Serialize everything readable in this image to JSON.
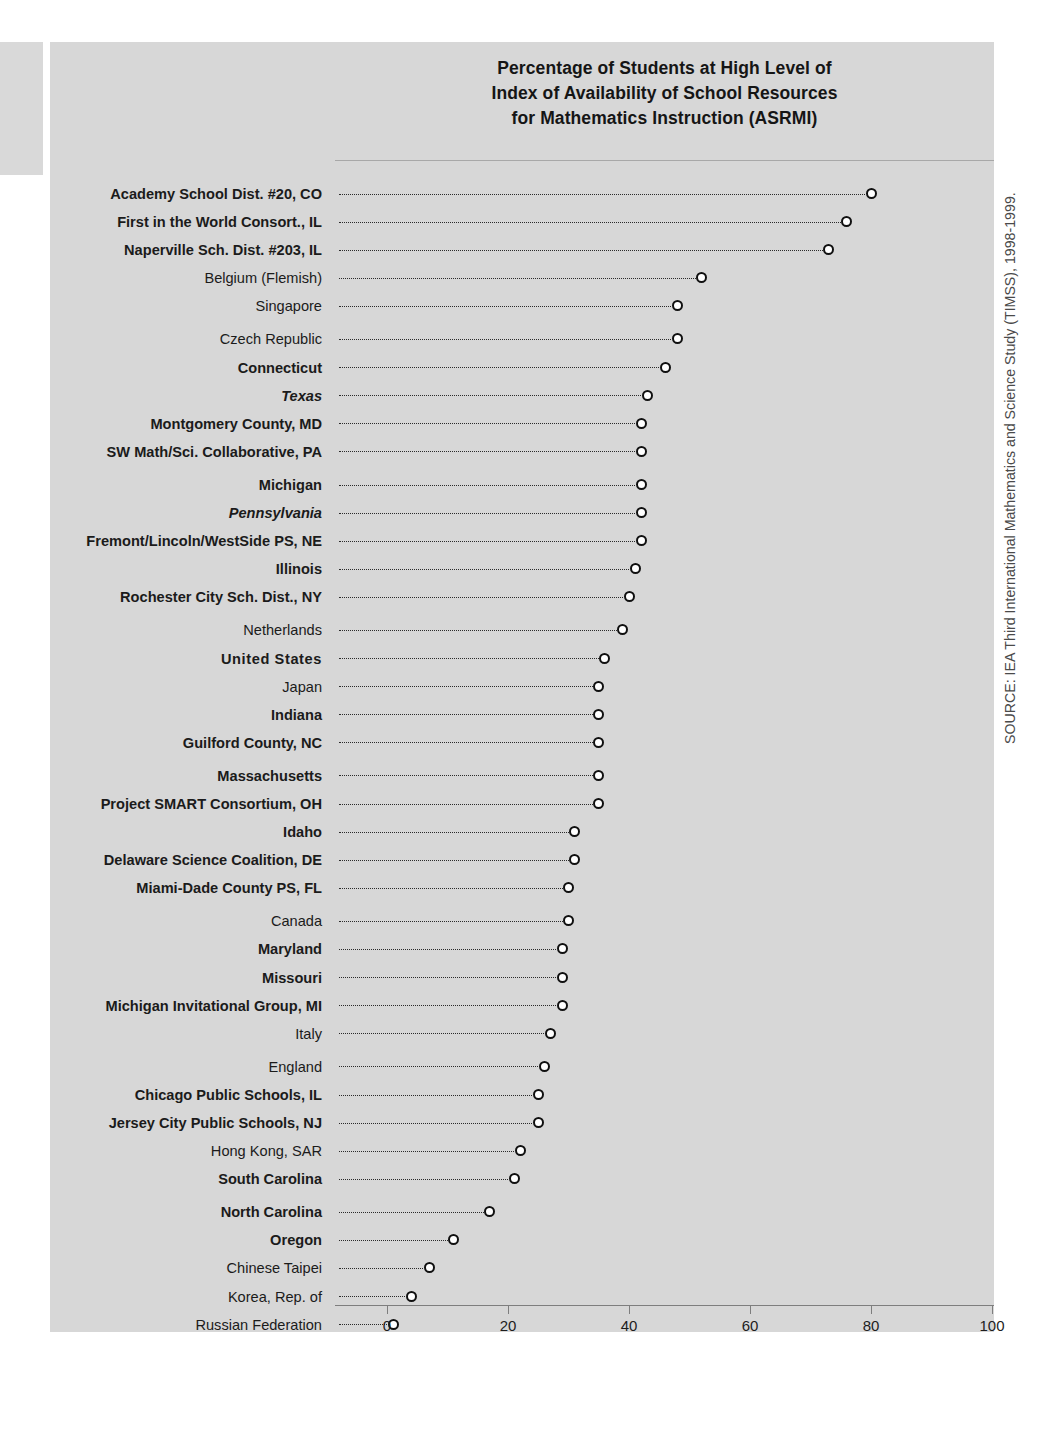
{
  "chart_data": {
    "type": "bar",
    "title": "Percentage of Students at High Level of Index of Availability of School Resources for Mathematics Instruction (ASRMI)",
    "title_lines": [
      "Percentage of Students at High Level of",
      "Index of Availability of School Resources",
      "for Mathematics Instruction (ASRMI)"
    ],
    "xlabel": "",
    "ylabel": "",
    "xlim": [
      0,
      100
    ],
    "xticks": [
      0,
      20,
      40,
      60,
      80,
      100
    ],
    "xtick_labels": [
      "0",
      "20",
      "40",
      "60",
      "80",
      "100"
    ],
    "grid": false,
    "legend": null,
    "orientation": "horizontal",
    "marker": "open-circle",
    "categories": [
      "Academy School Dist. #20, CO",
      "First in the World Consort., IL",
      "Naperville Sch. Dist. #203, IL",
      "Belgium (Flemish)",
      "Singapore",
      "Czech Republic",
      "Connecticut",
      "Texas",
      "Montgomery County, MD",
      "SW Math/Sci. Collaborative, PA",
      "Michigan",
      "Pennsylvania",
      "Fremont/Lincoln/WestSide PS, NE",
      "Illinois",
      "Rochester City Sch. Dist., NY",
      "Netherlands",
      "United States",
      "Japan",
      "Indiana",
      "Guilford County, NC",
      "Massachusetts",
      "Project SMART Consortium, OH",
      "Idaho",
      "Delaware Science Coalition, DE",
      "Miami-Dade County PS, FL",
      "Canada",
      "Maryland",
      "Missouri",
      "Michigan Invitational Group, MI",
      "Italy",
      "England",
      "Chicago Public Schools, IL",
      "Jersey City Public Schools, NJ",
      "Hong Kong, SAR",
      "South Carolina",
      "North Carolina",
      "Oregon",
      "Chinese Taipei",
      "Korea, Rep. of",
      "Russian Federation"
    ],
    "values": [
      80,
      76,
      73,
      52,
      48,
      48,
      46,
      43,
      42,
      42,
      42,
      42,
      42,
      41,
      40,
      39,
      36,
      35,
      35,
      35,
      35,
      35,
      31,
      31,
      30,
      30,
      29,
      29,
      29,
      27,
      26,
      25,
      25,
      22,
      21,
      17,
      11,
      7,
      4,
      1
    ],
    "rows": [
      {
        "label": "Academy School Dist. #20, CO",
        "value": 80,
        "style": "bold",
        "group": 1
      },
      {
        "label": "First in the World Consort., IL",
        "value": 76,
        "style": "bold",
        "group": 1
      },
      {
        "label": "Naperville Sch. Dist. #203, IL",
        "value": 73,
        "style": "bold",
        "group": 1
      },
      {
        "label": "Belgium (Flemish)",
        "value": 52,
        "style": "regular",
        "group": 1
      },
      {
        "label": "Singapore",
        "value": 48,
        "style": "regular",
        "group": 1
      },
      {
        "label": "Czech Republic",
        "value": 48,
        "style": "regular",
        "group": 2
      },
      {
        "label": "Connecticut",
        "value": 46,
        "style": "bold",
        "group": 2
      },
      {
        "label": "Texas",
        "value": 43,
        "style": "bold-italic",
        "group": 2
      },
      {
        "label": "Montgomery County, MD",
        "value": 42,
        "style": "bold",
        "group": 2
      },
      {
        "label": "SW Math/Sci. Collaborative, PA",
        "value": 42,
        "style": "bold",
        "group": 2
      },
      {
        "label": "Michigan",
        "value": 42,
        "style": "bold",
        "group": 3
      },
      {
        "label": "Pennsylvania",
        "value": 42,
        "style": "bold-italic",
        "group": 3
      },
      {
        "label": "Fremont/Lincoln/WestSide PS, NE",
        "value": 42,
        "style": "bold",
        "group": 3
      },
      {
        "label": "Illinois",
        "value": 41,
        "style": "bold",
        "group": 3
      },
      {
        "label": "Rochester City Sch. Dist., NY",
        "value": 40,
        "style": "bold",
        "group": 3
      },
      {
        "label": "Netherlands",
        "value": 39,
        "style": "regular",
        "group": 4
      },
      {
        "label": "United States",
        "value": 36,
        "style": "us",
        "group": 4
      },
      {
        "label": "Japan",
        "value": 35,
        "style": "regular",
        "group": 4
      },
      {
        "label": "Indiana",
        "value": 35,
        "style": "bold",
        "group": 4
      },
      {
        "label": "Guilford County, NC",
        "value": 35,
        "style": "bold",
        "group": 4
      },
      {
        "label": "Massachusetts",
        "value": 35,
        "style": "bold",
        "group": 5
      },
      {
        "label": "Project SMART Consortium, OH",
        "value": 35,
        "style": "bold",
        "group": 5
      },
      {
        "label": "Idaho",
        "value": 31,
        "style": "bold",
        "group": 5
      },
      {
        "label": "Delaware Science Coalition, DE",
        "value": 31,
        "style": "bold",
        "group": 5
      },
      {
        "label": "Miami-Dade County PS, FL",
        "value": 30,
        "style": "bold",
        "group": 5
      },
      {
        "label": "Canada",
        "value": 30,
        "style": "regular",
        "group": 6
      },
      {
        "label": "Maryland",
        "value": 29,
        "style": "bold",
        "group": 6
      },
      {
        "label": "Missouri",
        "value": 29,
        "style": "bold",
        "group": 6
      },
      {
        "label": "Michigan Invitational Group, MI",
        "value": 29,
        "style": "bold",
        "group": 6
      },
      {
        "label": "Italy",
        "value": 27,
        "style": "regular",
        "group": 6
      },
      {
        "label": "England",
        "value": 26,
        "style": "regular",
        "group": 7
      },
      {
        "label": "Chicago Public Schools, IL",
        "value": 25,
        "style": "bold",
        "group": 7
      },
      {
        "label": "Jersey City Public Schools, NJ",
        "value": 25,
        "style": "bold",
        "group": 7
      },
      {
        "label": "Hong Kong, SAR",
        "value": 22,
        "style": "regular",
        "group": 7
      },
      {
        "label": "South Carolina",
        "value": 21,
        "style": "bold",
        "group": 7
      },
      {
        "label": "North Carolina",
        "value": 17,
        "style": "bold",
        "group": 8
      },
      {
        "label": "Oregon",
        "value": 11,
        "style": "bold",
        "group": 8
      },
      {
        "label": "Chinese Taipei",
        "value": 7,
        "style": "regular",
        "group": 8
      },
      {
        "label": "Korea, Rep. of",
        "value": 4,
        "style": "regular",
        "group": 8
      },
      {
        "label": "Russian Federation",
        "value": 1,
        "style": "regular",
        "group": 8
      }
    ]
  },
  "source_note": "SOURCE: IEA Third International Mathematics and Science Study (TIMSS), 1998-1999.",
  "colors": {
    "panel_background": "#d7d7d7",
    "page_background": "#ffffff",
    "text": "#1b1b1b",
    "marker_stroke": "#101010",
    "marker_fill": "#ffffff",
    "axis": "#7e7e7e"
  }
}
